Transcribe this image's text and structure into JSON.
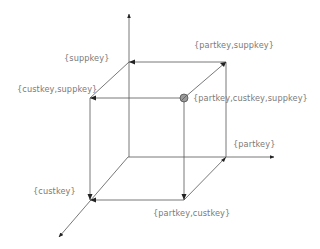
{
  "diagram": {
    "colors": {
      "line": "#555555",
      "label": "#7a7a7a",
      "node_fill": "#9a9a9a"
    },
    "labels": {
      "suppkey": "{suppkey}",
      "partkey_suppkey": "{partkey,suppkey}",
      "custkey_suppkey": "{custkey,suppkey}",
      "partkey_custkey_suppkey": "{partkey,custkey,suppkey}",
      "partkey": "{partkey}",
      "custkey": "{custkey}",
      "partkey_custkey": "{partkey,custkey}"
    },
    "axes": [
      {
        "name": "suppkey-axis",
        "direction": "up"
      },
      {
        "name": "partkey-axis",
        "direction": "right"
      },
      {
        "name": "custkey-axis",
        "direction": "down-left"
      }
    ],
    "highlighted_node": "{partkey,custkey,suppkey}"
  }
}
